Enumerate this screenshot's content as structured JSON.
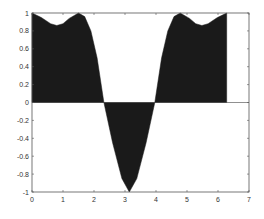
{
  "chart_data": {
    "type": "area",
    "title": "",
    "xlabel": "",
    "ylabel": "",
    "xlim": [
      0,
      7
    ],
    "ylim": [
      -1,
      1
    ],
    "grid": false,
    "legend": null,
    "fill_color": "#1a1a1a",
    "x_ticks": [
      "0",
      "1",
      "2",
      "3",
      "4",
      "5",
      "6",
      "7"
    ],
    "y_ticks": [
      "-1",
      "-0.8",
      "-0.6",
      "-0.4",
      "-0.2",
      "0",
      "0.2",
      "0.4",
      "0.6",
      "0.8",
      "1"
    ],
    "series": [
      {
        "name": "filled curve",
        "x": [
          0,
          0.3,
          0.6,
          0.8,
          1.0,
          1.2,
          1.5,
          1.7,
          1.9,
          2.1,
          2.32,
          2.6,
          2.9,
          3.14,
          3.38,
          3.68,
          3.96,
          4.18,
          4.38,
          4.58,
          4.78,
          5.08,
          5.28,
          5.48,
          5.68,
          5.98,
          6.28
        ],
        "y": [
          1.0,
          0.95,
          0.88,
          0.86,
          0.88,
          0.94,
          1.0,
          0.96,
          0.8,
          0.5,
          0.0,
          -0.45,
          -0.85,
          -1.0,
          -0.85,
          -0.45,
          0.0,
          0.5,
          0.8,
          0.96,
          1.0,
          0.94,
          0.88,
          0.86,
          0.88,
          0.95,
          1.0
        ]
      }
    ]
  }
}
